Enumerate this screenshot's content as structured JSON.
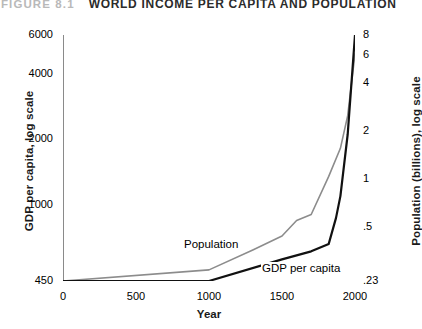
{
  "figure": {
    "number": "FIGURE 8.1",
    "title": "WORLD INCOME PER CAPITA AND POPULATION"
  },
  "chart_data": {
    "type": "line",
    "title": "WORLD INCOME PER CAPITA AND POPULATION",
    "xlabel": "Year",
    "ylabel": "GDP per capita, log scale",
    "ylabel_right": "Population (billions), log scale",
    "xlim": [
      0,
      2000
    ],
    "ylim": [
      450,
      6000
    ],
    "ylim_right": [
      0.23,
      8
    ],
    "yscale": "log",
    "yscale_right": "log",
    "grid": false,
    "legend": "inline-annotations",
    "xticks": [
      0,
      500,
      1000,
      1500,
      2000
    ],
    "xticklabels": [
      "0",
      "500",
      "1000",
      "1500",
      "2000"
    ],
    "yticks_left": [
      450,
      1000,
      2000,
      4000,
      6000
    ],
    "yticklabels_left": [
      "450",
      "1000",
      "2000",
      "4000",
      "6000"
    ],
    "yticks_right": [
      0.23,
      0.5,
      1,
      2,
      4,
      6,
      8
    ],
    "yticklabels_right": [
      ".23",
      ".5",
      "1",
      "2",
      "4",
      "6",
      "8"
    ],
    "series": [
      {
        "name": "Population",
        "color": "#8c8c8c",
        "axis": "right",
        "annotation": "Population",
        "x": [
          0,
          1000,
          1300,
          1500,
          1600,
          1700,
          1820,
          1900,
          1950,
          2000
        ],
        "y": [
          0.23,
          0.27,
          0.36,
          0.44,
          0.55,
          0.6,
          1.04,
          1.56,
          2.5,
          6.1
        ]
      },
      {
        "name": "GDP per capita",
        "color": "#111111",
        "axis": "left",
        "annotation": "GDP per capita",
        "x": [
          0,
          1000,
          1500,
          1700,
          1820,
          1870,
          1900,
          1950,
          2000
        ],
        "y": [
          450,
          450,
          565,
          615,
          665,
          875,
          1100,
          2110,
          6000
        ]
      }
    ]
  }
}
